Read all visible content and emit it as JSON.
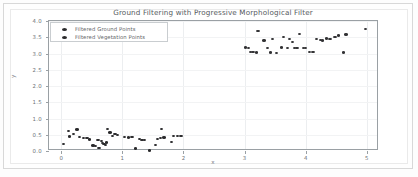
{
  "figure": {
    "background_color": "#fdfdfd",
    "frame_color": "#d8d8d8"
  },
  "chart_data": {
    "type": "scatter",
    "title": "Ground Filtering with Progressive Morphological Filter",
    "xlabel": "x",
    "ylabel": "y",
    "xlim": [
      -0.2,
      5.2
    ],
    "ylim": [
      0.0,
      4.0
    ],
    "xticks": [
      0,
      1,
      2,
      3,
      4,
      5
    ],
    "xtick_labels": [
      "0",
      "1",
      "2",
      "3",
      "4",
      "5"
    ],
    "yticks": [
      0.0,
      0.5,
      1.0,
      1.5,
      2.0,
      2.5,
      3.0,
      3.5,
      4.0
    ],
    "ytick_labels": [
      "0.0",
      "0.5",
      "1.0",
      "1.5",
      "2.0",
      "2.5",
      "3.0",
      "3.5",
      "4.0"
    ],
    "grid": true,
    "legend_position": "upper left",
    "series": [
      {
        "name": "Filtered Ground Points",
        "color": "#2a2a2c",
        "marker": "o",
        "points": [
          [
            0.04,
            0.22
          ],
          [
            0.12,
            0.62
          ],
          [
            0.14,
            0.45
          ],
          [
            0.2,
            0.52
          ],
          [
            0.26,
            0.66
          ],
          [
            0.3,
            0.44
          ],
          [
            0.36,
            0.4
          ],
          [
            0.42,
            0.4
          ],
          [
            0.46,
            0.35
          ],
          [
            0.52,
            0.17
          ],
          [
            0.56,
            0.16
          ],
          [
            0.6,
            0.34
          ],
          [
            0.62,
            0.09
          ],
          [
            0.66,
            0.3
          ],
          [
            0.68,
            0.24
          ],
          [
            0.7,
            0.21
          ],
          [
            0.72,
            0.19
          ],
          [
            0.74,
            0.26
          ],
          [
            0.76,
            0.67
          ],
          [
            0.8,
            0.57
          ],
          [
            0.84,
            0.47
          ],
          [
            0.88,
            0.52
          ],
          [
            0.92,
            0.49
          ],
          [
            1.04,
            0.44
          ],
          [
            1.1,
            0.42
          ],
          [
            1.16,
            0.44
          ],
          [
            1.22,
            0.08
          ],
          [
            1.28,
            0.37
          ],
          [
            1.32,
            0.34
          ],
          [
            1.36,
            0.33
          ],
          [
            1.44,
            0.02
          ],
          [
            1.54,
            0.18
          ],
          [
            1.58,
            0.37
          ],
          [
            1.62,
            0.4
          ],
          [
            1.64,
            0.67
          ],
          [
            1.68,
            0.42
          ],
          [
            1.8,
            0.28
          ],
          [
            1.84,
            0.46
          ],
          [
            1.9,
            0.47
          ],
          [
            1.96,
            0.46
          ]
        ]
      },
      {
        "name": "Filtered Vegetation Points",
        "color": "#313133",
        "marker": "o",
        "points": [
          [
            3.02,
            3.18
          ],
          [
            3.06,
            3.17
          ],
          [
            3.1,
            3.05
          ],
          [
            3.14,
            3.04
          ],
          [
            3.2,
            3.03
          ],
          [
            3.22,
            3.7
          ],
          [
            3.32,
            3.4
          ],
          [
            3.38,
            3.16
          ],
          [
            3.42,
            3.03
          ],
          [
            3.46,
            3.45
          ],
          [
            3.52,
            3.02
          ],
          [
            3.6,
            3.18
          ],
          [
            3.64,
            3.5
          ],
          [
            3.7,
            3.17
          ],
          [
            3.74,
            3.44
          ],
          [
            3.78,
            3.36
          ],
          [
            3.82,
            3.17
          ],
          [
            3.86,
            3.17
          ],
          [
            3.9,
            3.6
          ],
          [
            3.96,
            3.17
          ],
          [
            4.0,
            3.16
          ],
          [
            4.06,
            3.05
          ],
          [
            4.12,
            3.05
          ],
          [
            4.18,
            3.45
          ],
          [
            4.24,
            3.42
          ],
          [
            4.28,
            3.4
          ],
          [
            4.34,
            3.46
          ],
          [
            4.4,
            3.44
          ],
          [
            4.48,
            3.5
          ],
          [
            4.54,
            3.55
          ],
          [
            4.62,
            3.03
          ],
          [
            4.66,
            3.58
          ],
          [
            4.98,
            3.76
          ]
        ]
      }
    ]
  }
}
